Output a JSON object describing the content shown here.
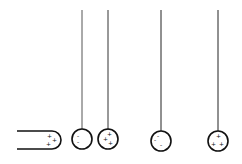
{
  "diagram": {
    "colors": {
      "stroke": "#111111",
      "background": "#ffffff"
    },
    "rod": {
      "charges": [
        "+",
        "+",
        "+"
      ]
    },
    "spheres": [
      {
        "id": "sphere-1",
        "charges": [
          "-",
          "-"
        ],
        "touching": "sphere-2"
      },
      {
        "id": "sphere-2",
        "charges": [
          "+",
          "+",
          "+"
        ],
        "touching": "sphere-1"
      },
      {
        "id": "sphere-3",
        "charges": [
          "-",
          "-",
          "-"
        ]
      },
      {
        "id": "sphere-4",
        "charges": [
          "+",
          "+",
          "+"
        ]
      }
    ]
  }
}
